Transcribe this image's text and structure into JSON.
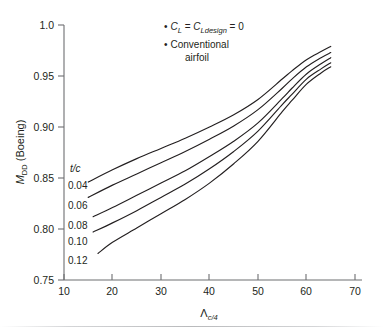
{
  "chart_data": {
    "type": "line",
    "title": "",
    "xlabel": "Λ",
    "xlabel_sub": "c/4",
    "ylabel": "M",
    "ylabel_sub": "DD",
    "ylabel_suffix": " (Boeing)",
    "xlim": [
      10,
      70
    ],
    "ylim": [
      0.75,
      1.0
    ],
    "xticks": [
      "10",
      "20",
      "30",
      "40",
      "50",
      "60",
      "70"
    ],
    "xtick_values": [
      10,
      20,
      30,
      40,
      50,
      60,
      70
    ],
    "yticks": [
      "0.75",
      "0.80",
      "0.85",
      "0.90",
      "0.95",
      "1.0"
    ],
    "ytick_values": [
      0.75,
      0.8,
      0.85,
      0.9,
      0.95,
      1.0
    ],
    "grid": false,
    "legend_position": "inline-left",
    "series_header": "t/c",
    "series": [
      {
        "name": "0.04",
        "x": [
          15,
          20,
          25,
          30,
          35,
          40,
          45,
          50,
          55,
          57,
          60,
          63,
          65
        ],
        "values": [
          0.846,
          0.858,
          0.869,
          0.879,
          0.889,
          0.9,
          0.912,
          0.927,
          0.947,
          0.955,
          0.966,
          0.974,
          0.979
        ]
      },
      {
        "name": "0.06",
        "x": [
          15,
          20,
          25,
          30,
          35,
          40,
          45,
          50,
          55,
          57,
          60,
          63,
          65
        ],
        "values": [
          0.831,
          0.843,
          0.854,
          0.865,
          0.876,
          0.888,
          0.901,
          0.917,
          0.938,
          0.947,
          0.959,
          0.968,
          0.973
        ]
      },
      {
        "name": "0.08",
        "x": [
          16,
          20,
          25,
          30,
          35,
          40,
          45,
          50,
          55,
          57,
          60,
          63,
          65
        ],
        "values": [
          0.812,
          0.821,
          0.833,
          0.845,
          0.857,
          0.871,
          0.886,
          0.904,
          0.928,
          0.938,
          0.952,
          0.962,
          0.968
        ]
      },
      {
        "name": "0.10",
        "x": [
          16,
          20,
          25,
          30,
          35,
          40,
          45,
          50,
          55,
          57,
          60,
          63,
          65
        ],
        "values": [
          0.797,
          0.806,
          0.818,
          0.831,
          0.844,
          0.859,
          0.876,
          0.896,
          0.922,
          0.932,
          0.947,
          0.957,
          0.963
        ]
      },
      {
        "name": "0.12",
        "x": [
          17,
          20,
          25,
          30,
          35,
          40,
          45,
          50,
          55,
          57,
          60,
          63,
          65
        ],
        "values": [
          0.776,
          0.787,
          0.801,
          0.815,
          0.829,
          0.845,
          0.864,
          0.886,
          0.915,
          0.926,
          0.942,
          0.953,
          0.959
        ]
      }
    ],
    "annotations": [
      {
        "id": "note-1",
        "text_parts": [
          "C",
          "L",
          " = ",
          "C",
          "Ldesign",
          " = 0"
        ]
      },
      {
        "id": "note-2",
        "line1": "Conventional",
        "line2": "airfoil"
      }
    ]
  },
  "notes": {
    "bullet": "•",
    "cl_symbol": "C",
    "cl_sub": "L",
    "equals_1": " = ",
    "cldesign_symbol": "C",
    "cldesign_sub": "Ldesign",
    "equals_zero": " = 0",
    "conventional": "Conventional",
    "airfoil": "airfoil"
  },
  "colors": {
    "curve": "#231f20",
    "axis": "#6d6e71",
    "text": "#231f20",
    "background": "#ffffff"
  }
}
